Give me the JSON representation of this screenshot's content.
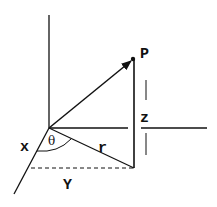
{
  "diagram": {
    "labels": {
      "point": "P",
      "x_axis": "x",
      "y_axis": "Y",
      "z_height": "z",
      "radius": "r",
      "angle": "θ"
    },
    "colors": {
      "line": "#111111",
      "background": "#ffffff"
    }
  }
}
